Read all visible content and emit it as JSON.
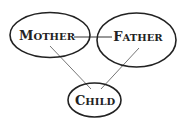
{
  "diagram": {
    "type": "family-relationship",
    "nodes": [
      {
        "id": "mother",
        "label_first": "M",
        "label_rest": "OTHER"
      },
      {
        "id": "father",
        "label_first": "F",
        "label_rest": "ATHER"
      },
      {
        "id": "child",
        "label_first": "C",
        "label_rest": "HILD"
      }
    ],
    "edges": [
      {
        "from": "mother",
        "to": "father"
      },
      {
        "from": "mother",
        "to": "child"
      },
      {
        "from": "father",
        "to": "child"
      }
    ],
    "colors": {
      "stroke": "#222222",
      "line": "#555555",
      "background": "#ffffff"
    }
  }
}
